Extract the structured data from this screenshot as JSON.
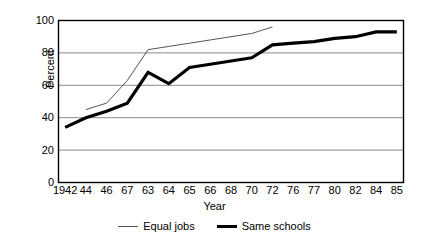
{
  "chart_data": {
    "type": "line",
    "title": "",
    "xlabel": "Year",
    "ylabel": "Percent",
    "ylim": [
      0,
      100
    ],
    "yticks": [
      0,
      20,
      40,
      60,
      80,
      100
    ],
    "grid": "horizontal",
    "legend_position": "bottom-center",
    "categories": [
      "1942",
      "44",
      "46",
      "67",
      "63",
      "64",
      "65",
      "66",
      "68",
      "70",
      "72",
      "76",
      "77",
      "80",
      "82",
      "84",
      "85"
    ],
    "series": [
      {
        "name": "Equal jobs",
        "style": "thin",
        "color": "#555555",
        "values": [
          null,
          45,
          49,
          63,
          82,
          84,
          86,
          88,
          90,
          92,
          96,
          null,
          null,
          null,
          null,
          null,
          null
        ]
      },
      {
        "name": "Same schools",
        "style": "thick",
        "color": "#000000",
        "values": [
          34,
          40,
          44,
          49,
          68,
          61,
          71,
          73,
          75,
          77,
          85,
          86,
          87,
          89,
          90,
          93,
          93
        ]
      }
    ]
  },
  "axis": {
    "y_title": "Percent",
    "x_title": "Year",
    "y_tick_labels": [
      "100",
      "80",
      "60",
      "40",
      "20",
      "0"
    ],
    "x_tick_labels": [
      "1942",
      "44",
      "46",
      "67",
      "63",
      "64",
      "65",
      "66",
      "68",
      "70",
      "72",
      "76",
      "77",
      "80",
      "82",
      "84",
      "85"
    ]
  },
  "legend": {
    "items": [
      {
        "label": "Equal jobs"
      },
      {
        "label": "Same schools"
      }
    ]
  }
}
